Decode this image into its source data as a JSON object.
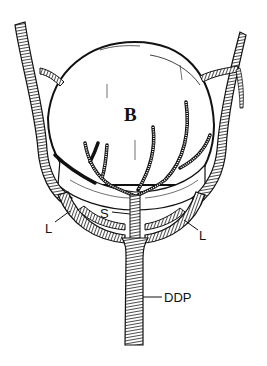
{
  "figure": {
    "colors": {
      "ink": "#111111",
      "background": "#ffffff"
    },
    "labels": {
      "organ": "B",
      "septum": "S",
      "left_lateral": "L",
      "right_lateral": "L",
      "trunk": "DDP"
    }
  }
}
